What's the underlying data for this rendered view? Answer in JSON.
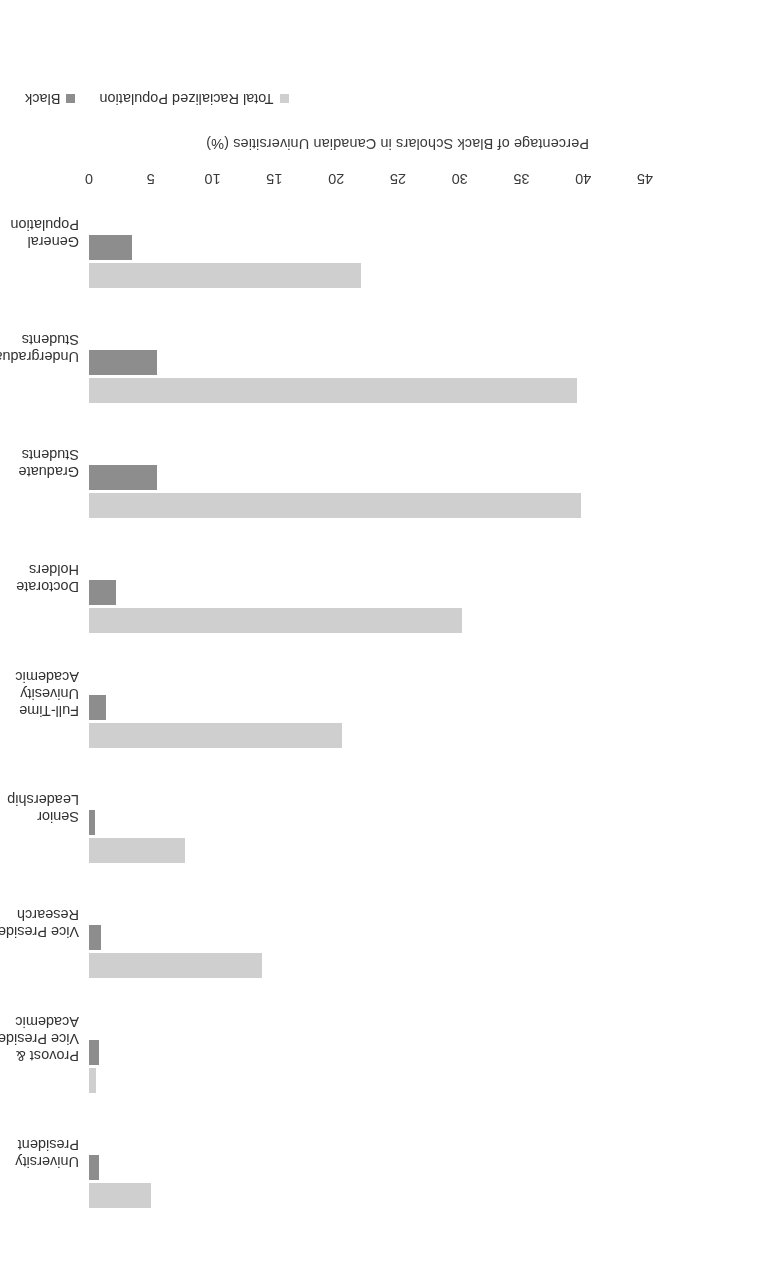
{
  "chart_data": {
    "type": "bar",
    "orientation": "horizontal",
    "title": "",
    "xlabel": "",
    "ylabel": "Percentage of Black Scholars in Canadian Universities (%)",
    "ylim": [
      0,
      45
    ],
    "yticks": [
      0,
      5,
      10,
      15,
      20,
      25,
      30,
      35,
      40,
      45
    ],
    "grid": false,
    "legend_position": "bottom-right",
    "rotated_180": true,
    "categories": [
      "University\nPresident",
      "Provost &\nVice President\nAcademic",
      "Vice President\nResearch",
      "Senior\nLeadership",
      "Full-Time\nUnivesity\nAcademic",
      "Doctorate\nHolders",
      "Graduate\nStudents",
      "Undergraduate\nStudents",
      "General\nPopulation"
    ],
    "series": [
      {
        "name": "Total Racialized Population",
        "color": "#cfcfcf",
        "values": [
          5.0,
          0.6,
          14.0,
          7.8,
          20.5,
          30.2,
          39.8,
          39.5,
          22.0
        ]
      },
      {
        "name": "Black",
        "color": "#8d8d8d",
        "values": [
          0.8,
          0.8,
          1.0,
          0.5,
          1.4,
          2.2,
          5.5,
          5.5,
          3.5
        ]
      }
    ]
  },
  "legend": {
    "items": [
      {
        "label": "Total Racialized Population",
        "swatch": "legend-swatch-total-racialized"
      },
      {
        "label": "Black",
        "swatch": "legend-swatch-black"
      }
    ]
  },
  "axis": {
    "tick_labels": [
      "0",
      "5",
      "10",
      "15",
      "20",
      "25",
      "30",
      "35",
      "40",
      "45"
    ],
    "title": "Percentage of Black Scholars in Canadian Universities (%)"
  }
}
